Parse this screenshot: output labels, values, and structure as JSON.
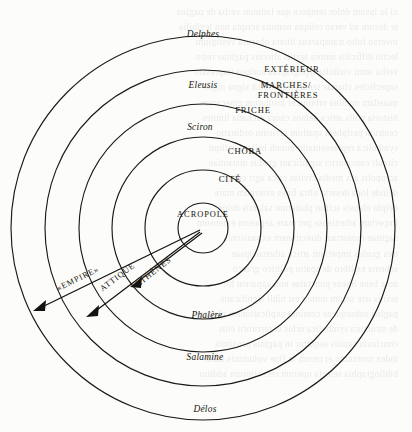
{
  "figure": {
    "type": "concentric-circle-diagram",
    "center": {
      "x": 203,
      "y": 228
    },
    "rings": [
      {
        "index": 1,
        "radius": 25,
        "inner_label": "ACROPOLE"
      },
      {
        "index": 2,
        "radius": 58,
        "inner_label": "CITÉ"
      },
      {
        "index": 3,
        "radius": 91,
        "inner_label": "CHÔRA"
      },
      {
        "index": 4,
        "radius": 124,
        "inner_label": "FRICHE"
      },
      {
        "index": 5,
        "radius": 158,
        "inner_label": "MARCHES/FRONTIÈRES"
      },
      {
        "index": 6,
        "radius": 192,
        "inner_label": "EXTÉRIEUR"
      }
    ],
    "ring_labels_right": [
      {
        "text": "EXTÉRIEUR",
        "x": 292,
        "y": 72
      },
      {
        "text": "MARCHES/",
        "x": 286,
        "y": 87
      },
      {
        "text": "FRONTIÈRES",
        "x": 288,
        "y": 97
      },
      {
        "text": "FRICHE",
        "x": 253,
        "y": 113
      },
      {
        "text": "CHÔRA",
        "x": 245,
        "y": 154
      },
      {
        "text": "CITÉ",
        "x": 230,
        "y": 182
      },
      {
        "text": "ACROPOLE",
        "x": 203,
        "y": 217
      }
    ],
    "place_labels": [
      {
        "text": "Delphes",
        "x": 203,
        "y": 37
      },
      {
        "text": "Eleusis",
        "x": 203,
        "y": 88
      },
      {
        "text": "Sciron",
        "x": 200,
        "y": 130
      },
      {
        "text": "Phalère",
        "x": 207,
        "y": 318
      },
      {
        "text": "Salamine",
        "x": 205,
        "y": 360
      },
      {
        "text": "Délos",
        "x": 205,
        "y": 412
      }
    ],
    "arrows": [
      {
        "label": "«EMPIRE»",
        "from": {
          "x": 200,
          "y": 230
        },
        "to": {
          "x": 33,
          "y": 311
        },
        "label_x": 79,
        "label_y": 281,
        "label_rotate": -26
      },
      {
        "label": "ATTIQUE",
        "from": {
          "x": 200,
          "y": 232
        },
        "to": {
          "x": 86,
          "y": 317
        },
        "label_x": 119,
        "label_y": 279,
        "label_rotate": -37
      },
      {
        "label": "ATHÈNES",
        "from": {
          "x": 202,
          "y": 233
        },
        "to": {
          "x": 130,
          "y": 287
        },
        "label_x": 155,
        "label_y": 274,
        "label_rotate": -38
      }
    ]
  },
  "colors": {
    "ink": "#17150f",
    "paper": "#fcfcfa",
    "stroke": "#1b1a16"
  },
  "ghost_text": {
    "lines": [
      "ni lo ipsum dolor tempore que latinum verba de pagina",
      "te decum ad verso reliqua nomina scripta non legibilia",
      "inverso folio transparens littera obscura vestigium",
      "lectio difficilis umbra textus alterius paginae retro",
      "verba semi visibilia typographia antiqua impressio",
      "superficies chartae tenuis transmittit signa nigra",
      "quaedam nomina urbium et insularum graecarum",
      "historia polis attica demos chora eschatia limites",
      "centrum periphera spatium civicum ordinatio",
      "symbolica repraesentatio mundi helleni antiqui",
      "circuli concentrici significant gradus distantiae",
      "acropolis arx media civitas circa agri cultura",
      "deinde loca deserta ultra fines externum mare",
      "delphi eleusis sciron phalerum salamis delos",
      "imperium atheniense per mare aegaeum extensum",
      "sagittae monstrant directionem expansionis",
      "tres gradus imperium attica athenae ipsae",
      "schema ex libro de spatio politico graeco",
      "nota bene lineae punctatae non apparent hic",
      "textus iste solum umbra est nihil significans",
      "pagina subsequens continet explicationem plenam",
      "de structura symbolica urbis et territorii eius",
      "conclusio capitis sequitur in paginis proximis",
      "index nominum et rerum in fine voluminis datur",
      "bibliographia selecta operum recentiorum additur"
    ]
  }
}
